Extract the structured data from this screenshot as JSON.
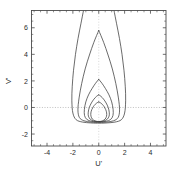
{
  "figure": {
    "background": "#ffffff",
    "frame_color": "#4a4a4a",
    "curve_color": "#3a3a3a",
    "zeroline_color": "#b0b0b0"
  },
  "chart_data": {
    "type": "line",
    "title": "",
    "xlabel": "U'",
    "ylabel": "V'",
    "xlim": [
      -5.2,
      5.2
    ],
    "ylim": [
      -2.9,
      7.3
    ],
    "xticks": [
      -4,
      -2,
      0,
      2,
      4
    ],
    "yticks": [
      -2,
      0,
      2,
      4,
      6
    ],
    "xticklabels": [
      "-4",
      "-2",
      "0",
      "2",
      "4"
    ],
    "yticklabels": [
      "-2",
      "0",
      "2",
      "4",
      "6"
    ],
    "minor_ticks": true,
    "minor_tick_step": 0.5,
    "grid": false,
    "legend": null,
    "zero_lines": {
      "horizontal_y": 0,
      "vertical_x": 0,
      "style": "dotted"
    },
    "series": [
      {
        "name": "curve-1",
        "cusp_apex": [
          0,
          0.42
        ],
        "max_halfwidth": 0.62,
        "bottom": [
          0,
          -1.05
        ],
        "points": [
          [
            0,
            0.42
          ],
          [
            -0.12,
            0.36
          ],
          [
            -0.27,
            0.24
          ],
          [
            -0.42,
            0.06
          ],
          [
            -0.54,
            -0.16
          ],
          [
            -0.61,
            -0.41
          ],
          [
            -0.6,
            -0.66
          ],
          [
            -0.49,
            -0.88
          ],
          [
            -0.3,
            -1.0
          ],
          [
            -0.12,
            -1.05
          ],
          [
            0,
            -1.06
          ],
          [
            0.12,
            -1.05
          ],
          [
            0.3,
            -1.0
          ],
          [
            0.49,
            -0.88
          ],
          [
            0.6,
            -0.66
          ],
          [
            0.61,
            -0.41
          ],
          [
            0.54,
            -0.16
          ],
          [
            0.42,
            0.06
          ],
          [
            0.27,
            0.24
          ],
          [
            0.12,
            0.36
          ],
          [
            0,
            0.42
          ]
        ]
      },
      {
        "name": "curve-2",
        "cusp_apex": [
          0,
          0.95
        ],
        "max_halfwidth": 0.82,
        "bottom": [
          0,
          -1.05
        ],
        "points": [
          [
            0,
            0.95
          ],
          [
            -0.17,
            0.84
          ],
          [
            -0.37,
            0.63
          ],
          [
            -0.57,
            0.34
          ],
          [
            -0.73,
            0.0
          ],
          [
            -0.81,
            -0.35
          ],
          [
            -0.8,
            -0.65
          ],
          [
            -0.65,
            -0.89
          ],
          [
            -0.4,
            -1.02
          ],
          [
            -0.16,
            -1.06
          ],
          [
            0,
            -1.07
          ],
          [
            0.16,
            -1.06
          ],
          [
            0.4,
            -1.02
          ],
          [
            0.65,
            -0.89
          ],
          [
            0.8,
            -0.65
          ],
          [
            0.81,
            -0.35
          ],
          [
            0.73,
            0.0
          ],
          [
            0.57,
            0.34
          ],
          [
            0.37,
            0.63
          ],
          [
            0.17,
            0.84
          ],
          [
            0,
            0.95
          ]
        ]
      },
      {
        "name": "curve-3",
        "cusp_apex": [
          0,
          2.12
        ],
        "max_halfwidth": 1.12,
        "bottom": [
          0,
          -1.05
        ],
        "points": [
          [
            0,
            2.12
          ],
          [
            -0.25,
            1.82
          ],
          [
            -0.52,
            1.42
          ],
          [
            -0.79,
            0.95
          ],
          [
            -1.0,
            0.42
          ],
          [
            -1.11,
            -0.15
          ],
          [
            -1.1,
            -0.6
          ],
          [
            -0.92,
            -0.9
          ],
          [
            -0.58,
            -1.04
          ],
          [
            -0.22,
            -1.08
          ],
          [
            0,
            -1.09
          ],
          [
            0.22,
            -1.08
          ],
          [
            0.58,
            -1.04
          ],
          [
            0.92,
            -0.9
          ],
          [
            1.1,
            -0.6
          ],
          [
            1.11,
            -0.15
          ],
          [
            1.0,
            0.42
          ],
          [
            0.79,
            0.95
          ],
          [
            0.52,
            1.42
          ],
          [
            0.25,
            1.82
          ],
          [
            0,
            2.12
          ]
        ]
      },
      {
        "name": "curve-4",
        "cusp_apex": [
          0,
          5.8
        ],
        "max_halfwidth": 1.62,
        "bottom": [
          0,
          -1.05
        ],
        "points": [
          [
            0,
            5.8
          ],
          [
            -0.38,
            4.9
          ],
          [
            -0.72,
            3.95
          ],
          [
            -1.05,
            2.9
          ],
          [
            -1.32,
            1.8
          ],
          [
            -1.52,
            0.72
          ],
          [
            -1.61,
            -0.18
          ],
          [
            -1.5,
            -0.75
          ],
          [
            -1.15,
            -1.0
          ],
          [
            -0.6,
            -1.1
          ],
          [
            -0.22,
            -1.12
          ],
          [
            0,
            -1.12
          ],
          [
            0.22,
            -1.12
          ],
          [
            0.6,
            -1.1
          ],
          [
            1.15,
            -1.0
          ],
          [
            1.5,
            -0.75
          ],
          [
            1.61,
            -0.18
          ],
          [
            1.52,
            0.72
          ],
          [
            1.32,
            1.8
          ],
          [
            1.05,
            2.9
          ],
          [
            0.72,
            3.95
          ],
          [
            0.38,
            4.9
          ],
          [
            0,
            5.8
          ]
        ]
      },
      {
        "name": "curve-5",
        "cusp_apex": [
          0,
          7.3
        ],
        "max_halfwidth": 2.08,
        "bottom": [
          0,
          -1.05
        ],
        "clipped_at_top": true,
        "points": [
          [
            -1.18,
            7.3
          ],
          [
            -1.38,
            6.3
          ],
          [
            -1.6,
            5.2
          ],
          [
            -1.8,
            4.0
          ],
          [
            -1.95,
            2.8
          ],
          [
            -2.05,
            1.6
          ],
          [
            -2.08,
            0.5
          ],
          [
            -2.0,
            -0.42
          ],
          [
            -1.75,
            -0.92
          ],
          [
            -1.25,
            -1.1
          ],
          [
            -0.65,
            -1.16
          ],
          [
            -0.22,
            -1.18
          ],
          [
            0,
            -1.18
          ],
          [
            0.22,
            -1.18
          ],
          [
            0.65,
            -1.16
          ],
          [
            1.25,
            -1.1
          ],
          [
            1.75,
            -0.92
          ],
          [
            2.0,
            -0.42
          ],
          [
            2.08,
            0.5
          ],
          [
            2.05,
            1.6
          ],
          [
            1.95,
            2.8
          ],
          [
            1.8,
            4.0
          ],
          [
            1.6,
            5.2
          ],
          [
            1.38,
            6.3
          ],
          [
            1.18,
            7.3
          ]
        ]
      }
    ]
  }
}
